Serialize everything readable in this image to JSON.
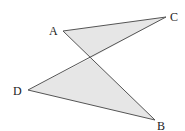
{
  "diagram": {
    "type": "geometry",
    "colors": {
      "stroke": "#555555",
      "fill": "#e6e6e6",
      "label": "#222222"
    },
    "points": {
      "A": {
        "label": "A",
        "x": 63,
        "y": 31,
        "lx": 49,
        "ly": 35
      },
      "C": {
        "label": "C",
        "x": 166,
        "y": 17,
        "lx": 170,
        "ly": 21
      },
      "D": {
        "label": "D",
        "x": 28,
        "y": 90,
        "lx": 13,
        "ly": 95
      },
      "B": {
        "label": "B",
        "x": 155,
        "y": 120,
        "lx": 157,
        "ly": 130
      }
    },
    "intersection": {
      "x": 91,
      "y": 58
    },
    "segments": [
      "AC",
      "AB",
      "CD",
      "DB"
    ],
    "shaded_triangles": [
      "A-C-O",
      "D-O-B"
    ]
  }
}
